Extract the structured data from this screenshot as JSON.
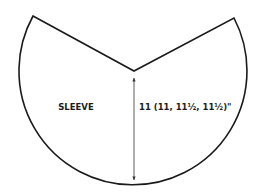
{
  "diagram": {
    "piece_label": "SLEEVE",
    "dimension_label": "11 (11, 11½, 11½)\"",
    "dimension_type": "length (notch to hem)",
    "outline_color": "#1a1a1a",
    "dimension_line_color": "#333333",
    "background_color": "#ffffff"
  }
}
